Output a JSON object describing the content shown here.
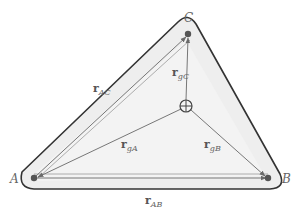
{
  "diagram": {
    "type": "triangle-center-of-gravity",
    "colors": {
      "outline": "#333333",
      "fill": "#ececec",
      "inner_fill": "#f4f4f4",
      "vector": "#777777",
      "point": "#555555",
      "text": "#555555"
    },
    "vertices": [
      {
        "id": "A",
        "label": "A",
        "x": 34,
        "y": 178
      },
      {
        "id": "B",
        "label": "B",
        "x": 268,
        "y": 178
      },
      {
        "id": "C",
        "label": "C",
        "x": 188,
        "y": 34
      }
    ],
    "center_of_gravity": {
      "label": "g",
      "x": 186,
      "y": 106
    },
    "vectors": [
      {
        "id": "r_AC",
        "main": "r",
        "sub": "AC",
        "from": "A",
        "to": "C"
      },
      {
        "id": "r_AB",
        "main": "r",
        "sub": "AB",
        "from": "A",
        "to": "B"
      },
      {
        "id": "r_gA",
        "main": "r",
        "sub": "gA",
        "from": "g",
        "to": "A"
      },
      {
        "id": "r_gB",
        "main": "r",
        "sub": "gB",
        "from": "g",
        "to": "B"
      },
      {
        "id": "r_gC",
        "main": "r",
        "sub": "gC",
        "from": "g",
        "to": "C"
      }
    ]
  }
}
